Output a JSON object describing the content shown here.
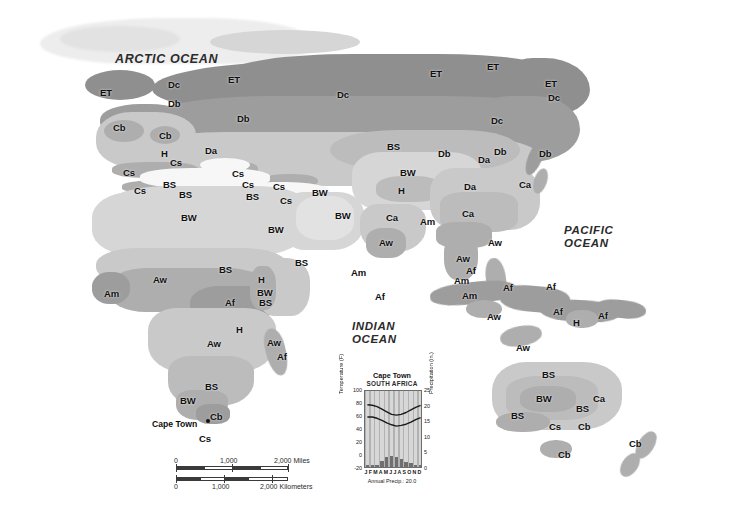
{
  "map": {
    "title": "World Climate Regions — Eastern Hemisphere",
    "ocean_labels": [
      {
        "name": "arctic-ocean",
        "text": "ARCTIC OCEAN",
        "x": 115,
        "y": 52,
        "size": "big"
      },
      {
        "name": "indian-ocean-line1",
        "text": "INDIAN",
        "x": 352,
        "y": 320,
        "size": "med"
      },
      {
        "name": "indian-ocean-line2",
        "text": "OCEAN",
        "x": 352,
        "y": 333,
        "size": "med"
      },
      {
        "name": "pacific-ocean-line1",
        "text": "PACIFIC",
        "x": 564,
        "y": 224,
        "size": "med"
      },
      {
        "name": "pacific-ocean-line2",
        "text": "OCEAN",
        "x": 564,
        "y": 237,
        "size": "med"
      }
    ],
    "city": {
      "label": "Cape Town",
      "label_x": 152,
      "label_y": 419,
      "dot_x": 206,
      "dot_y": 419
    },
    "climate_codes": [
      {
        "text": "ET",
        "x": 100,
        "y": 88
      },
      {
        "text": "Dc",
        "x": 168,
        "y": 80
      },
      {
        "text": "Db",
        "x": 168,
        "y": 99
      },
      {
        "text": "ET",
        "x": 228,
        "y": 75
      },
      {
        "text": "Db",
        "x": 237,
        "y": 114
      },
      {
        "text": "Dc",
        "x": 337,
        "y": 90
      },
      {
        "text": "ET",
        "x": 430,
        "y": 69
      },
      {
        "text": "ET",
        "x": 487,
        "y": 62
      },
      {
        "text": "ET",
        "x": 545,
        "y": 79
      },
      {
        "text": "Dc",
        "x": 548,
        "y": 93
      },
      {
        "text": "Cb",
        "x": 113,
        "y": 123
      },
      {
        "text": "Cb",
        "x": 159,
        "y": 131
      },
      {
        "text": "H",
        "x": 161,
        "y": 149
      },
      {
        "text": "Cs",
        "x": 170,
        "y": 158
      },
      {
        "text": "Da",
        "x": 205,
        "y": 146
      },
      {
        "text": "Cs",
        "x": 123,
        "y": 168
      },
      {
        "text": "Cs",
        "x": 232,
        "y": 169
      },
      {
        "text": "BS",
        "x": 163,
        "y": 180
      },
      {
        "text": "Cs",
        "x": 134,
        "y": 186
      },
      {
        "text": "Cs",
        "x": 242,
        "y": 180
      },
      {
        "text": "BS",
        "x": 179,
        "y": 190
      },
      {
        "text": "Cs",
        "x": 273,
        "y": 182
      },
      {
        "text": "BS",
        "x": 246,
        "y": 192
      },
      {
        "text": "Cs",
        "x": 280,
        "y": 196
      },
      {
        "text": "BW",
        "x": 312,
        "y": 188
      },
      {
        "text": "BS",
        "x": 387,
        "y": 142
      },
      {
        "text": "BW",
        "x": 400,
        "y": 168
      },
      {
        "text": "Db",
        "x": 438,
        "y": 149
      },
      {
        "text": "Db",
        "x": 494,
        "y": 147
      },
      {
        "text": "Dc",
        "x": 491,
        "y": 116
      },
      {
        "text": "Db",
        "x": 539,
        "y": 149
      },
      {
        "text": "Da",
        "x": 478,
        "y": 155
      },
      {
        "text": "Ca",
        "x": 519,
        "y": 180
      },
      {
        "text": "Da",
        "x": 464,
        "y": 182
      },
      {
        "text": "H",
        "x": 398,
        "y": 186
      },
      {
        "text": "BW",
        "x": 181,
        "y": 213
      },
      {
        "text": "BW",
        "x": 268,
        "y": 225
      },
      {
        "text": "BW",
        "x": 335,
        "y": 211
      },
      {
        "text": "Ca",
        "x": 386,
        "y": 213
      },
      {
        "text": "Am",
        "x": 420,
        "y": 217
      },
      {
        "text": "Ca",
        "x": 462,
        "y": 209
      },
      {
        "text": "Aw",
        "x": 379,
        "y": 238
      },
      {
        "text": "Aw",
        "x": 488,
        "y": 238
      },
      {
        "text": "BS",
        "x": 295,
        "y": 258
      },
      {
        "text": "BS",
        "x": 219,
        "y": 265
      },
      {
        "text": "Am",
        "x": 104,
        "y": 289
      },
      {
        "text": "Aw",
        "x": 153,
        "y": 275
      },
      {
        "text": "H",
        "x": 258,
        "y": 275
      },
      {
        "text": "BW",
        "x": 257,
        "y": 288
      },
      {
        "text": "BS",
        "x": 259,
        "y": 298
      },
      {
        "text": "Af",
        "x": 225,
        "y": 298
      },
      {
        "text": "Am",
        "x": 351,
        "y": 268
      },
      {
        "text": "Af",
        "x": 375,
        "y": 292
      },
      {
        "text": "Aw",
        "x": 456,
        "y": 254
      },
      {
        "text": "Af",
        "x": 466,
        "y": 266
      },
      {
        "text": "Am",
        "x": 454,
        "y": 276
      },
      {
        "text": "Am",
        "x": 462,
        "y": 291
      },
      {
        "text": "Af",
        "x": 503,
        "y": 283
      },
      {
        "text": "Af",
        "x": 546,
        "y": 282
      },
      {
        "text": "Af",
        "x": 553,
        "y": 307
      },
      {
        "text": "H",
        "x": 573,
        "y": 318
      },
      {
        "text": "Af",
        "x": 598,
        "y": 311
      },
      {
        "text": "Aw",
        "x": 487,
        "y": 312
      },
      {
        "text": "Aw",
        "x": 516,
        "y": 343
      },
      {
        "text": "H",
        "x": 236,
        "y": 325
      },
      {
        "text": "Aw",
        "x": 207,
        "y": 339
      },
      {
        "text": "Aw",
        "x": 267,
        "y": 338
      },
      {
        "text": "Af",
        "x": 277,
        "y": 352
      },
      {
        "text": "BS",
        "x": 205,
        "y": 382
      },
      {
        "text": "BW",
        "x": 180,
        "y": 396
      },
      {
        "text": "Cb",
        "x": 210,
        "y": 412
      },
      {
        "text": "Cs",
        "x": 199,
        "y": 434
      },
      {
        "text": "BS",
        "x": 542,
        "y": 370
      },
      {
        "text": "BW",
        "x": 536,
        "y": 394
      },
      {
        "text": "BS",
        "x": 511,
        "y": 411
      },
      {
        "text": "BS",
        "x": 576,
        "y": 404
      },
      {
        "text": "Ca",
        "x": 593,
        "y": 394
      },
      {
        "text": "Cb",
        "x": 578,
        "y": 422
      },
      {
        "text": "Cs",
        "x": 549,
        "y": 422
      },
      {
        "text": "Cb",
        "x": 558,
        "y": 450
      },
      {
        "text": "Cb",
        "x": 629,
        "y": 439
      }
    ]
  },
  "scalebar": {
    "miles": {
      "labels": [
        "0",
        "1,000",
        "2,000 Miles"
      ]
    },
    "kilometers": {
      "labels": [
        "0",
        "1,000",
        "2,000 Kilometers"
      ]
    }
  },
  "chart_data": {
    "type": "bar",
    "title": "Cape Town",
    "subtitle": "SOUTH AFRICA",
    "categories": [
      "J",
      "F",
      "M",
      "A",
      "M",
      "J",
      "J",
      "A",
      "S",
      "O",
      "N",
      "D"
    ],
    "xlabel": "",
    "ylabel": "Temperature (F)",
    "y2label": "Precipitation (in.)",
    "ylim": [
      -20,
      100
    ],
    "yticks": [
      -20,
      0,
      20,
      40,
      60,
      80,
      100
    ],
    "y2lim": [
      0,
      25
    ],
    "y2ticks": [
      0,
      5,
      10,
      15,
      20,
      25
    ],
    "annual_note": "Annual Precip.: 20.0",
    "series": [
      {
        "name": "Average high temperature (F)",
        "type": "line",
        "values": [
          79,
          78,
          76,
          72,
          68,
          64,
          63,
          64,
          67,
          71,
          75,
          78
        ]
      },
      {
        "name": "Average low temperature (F)",
        "type": "line",
        "values": [
          60,
          60,
          58,
          55,
          51,
          48,
          46,
          47,
          49,
          52,
          56,
          59
        ]
      },
      {
        "name": "Monthly precipitation (in.)",
        "type": "bar",
        "values": [
          0.6,
          0.6,
          0.8,
          1.9,
          3.1,
          3.5,
          3.3,
          2.6,
          1.7,
          1.2,
          0.7,
          0.6
        ]
      }
    ]
  }
}
